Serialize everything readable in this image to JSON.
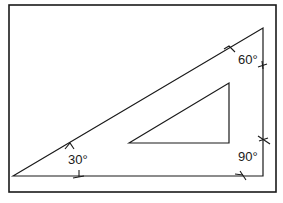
{
  "diagram": {
    "angles": [
      {
        "label": "30°"
      },
      {
        "label": "60°"
      },
      {
        "label": "90°"
      }
    ],
    "colors": {
      "line": "#1a1a1a",
      "background": "#ffffff"
    }
  }
}
